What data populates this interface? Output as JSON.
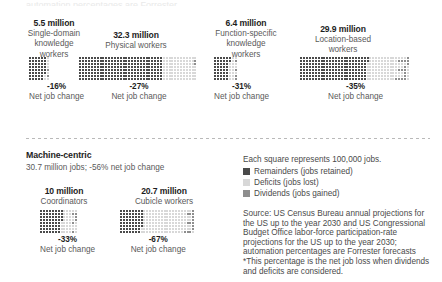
{
  "clipped_top_text": "automation percentages are Forrester",
  "legend": {
    "title": "Each square represents 100,000 jobs.",
    "items": [
      {
        "label": "Remainders (jobs retained)",
        "color": "#4a4a4a",
        "key": "remainders"
      },
      {
        "label": "Deficits (jobs lost)",
        "color": "#d8d8d8",
        "key": "deficits"
      },
      {
        "label": "Dividends (jobs gained)",
        "color": "#8e8e8e",
        "key": "dividends"
      }
    ]
  },
  "machine_centric": {
    "title": "Machine-centric",
    "subtitle": "30.7 million jobs; -56% net job change"
  },
  "source": {
    "lines": [
      "Source: US Census Bureau annual projections for",
      "the US up to the year 2030 and US Congressional",
      "Budget Office labor-force participation-rate",
      "projections for the US up to the year 2030;",
      "automation percentages are Forrester forecasts",
      "*This percentage is the net job loss when dividends",
      "and deficits are considered."
    ]
  },
  "net_job_change_label": "Net job change",
  "chart_data": {
    "type": "bar",
    "unit": "Each square represents 100,000 jobs",
    "series_keys": [
      "remainders",
      "deficits",
      "dividends"
    ],
    "groups": [
      {
        "name": "Single-domain knowledge workers",
        "total_label": "5.5 million",
        "label_lines": [
          "Single-domain",
          "knowledge",
          "workers"
        ],
        "total_millions": 5.5,
        "squares_total": 55,
        "remainders": 46,
        "deficits": 8,
        "dividends": 1,
        "rows": 8,
        "cols": 7,
        "net_change_pct": "-16%",
        "net_change_value": -16
      },
      {
        "name": "Physical workers",
        "total_label": "32.3 million",
        "label_lines": [
          "Physical workers"
        ],
        "total_millions": 32.3,
        "squares_total": 323,
        "remainders": 232,
        "deficits": 90,
        "dividends": 1,
        "rows": 8,
        "cols": 41,
        "net_change_pct": "-27%",
        "net_change_value": -27
      },
      {
        "name": "Function-specific knowledge workers",
        "total_label": "6.4 million",
        "label_lines": [
          "Function-specific",
          "knowledge",
          "workers"
        ],
        "total_millions": 6.4,
        "squares_total": 64,
        "remainders": 42,
        "deficits": 20,
        "dividends": 2,
        "rows": 8,
        "cols": 8,
        "net_change_pct": "-31%",
        "net_change_value": -31
      },
      {
        "name": "Location-based workers",
        "total_label": "29.9 million",
        "label_lines": [
          "Location-based",
          "workers"
        ],
        "total_millions": 29.9,
        "squares_total": 299,
        "remainders": 186,
        "deficits": 105,
        "dividends": 8,
        "rows": 8,
        "cols": 38,
        "net_change_pct": "-35%",
        "net_change_value": -35
      },
      {
        "name": "Coordinators",
        "total_label": "10 million",
        "label_lines": [
          "Coordinators"
        ],
        "total_millions": 10.0,
        "squares_total": 100,
        "remainders": 60,
        "deficits": 37,
        "dividends": 3,
        "rows": 8,
        "cols": 13,
        "net_change_pct": "-33%",
        "net_change_value": -33
      },
      {
        "name": "Cubicle workers",
        "total_label": "20.7 million",
        "label_lines": [
          "Cubicle workers"
        ],
        "total_millions": 20.7,
        "squares_total": 207,
        "remainders": 62,
        "deficits": 138,
        "dividends": 7,
        "rows": 8,
        "cols": 26,
        "net_change_pct": "-67%",
        "net_change_value": -67
      }
    ]
  },
  "layout": {
    "panels": [
      {
        "group": 0,
        "left": 26,
        "top": 18,
        "cap_width": 56,
        "grid_left": 29,
        "grid_top": 57
      },
      {
        "group": 1,
        "left": 92,
        "top": 30,
        "cap_width": 88,
        "grid_left": 79,
        "grid_top": 57
      },
      {
        "group": 2,
        "left": 208,
        "top": 18,
        "cap_width": 76,
        "grid_left": 214,
        "grid_top": 57
      },
      {
        "group": 3,
        "left": 300,
        "top": 24,
        "cap_width": 86,
        "grid_left": 300,
        "grid_top": 57
      },
      {
        "group": 4,
        "left": 28,
        "top": 186,
        "cap_width": 72,
        "grid_left": 40,
        "grid_top": 210
      },
      {
        "group": 5,
        "left": 118,
        "top": 186,
        "cap_width": 92,
        "grid_left": 120,
        "grid_top": 210
      }
    ]
  }
}
